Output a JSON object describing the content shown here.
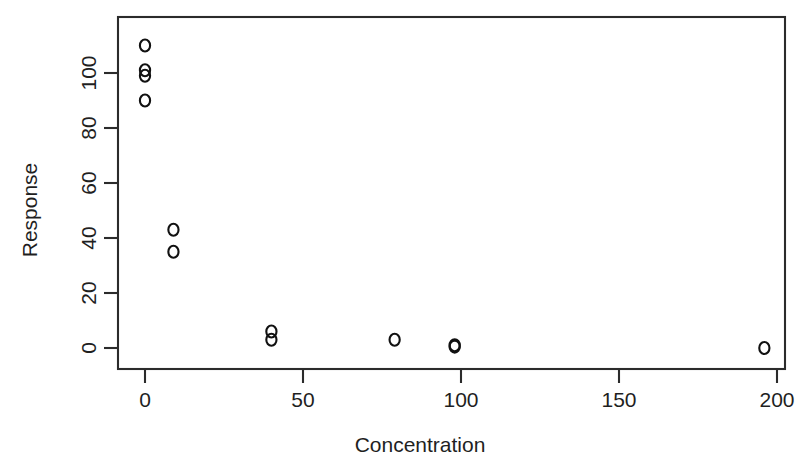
{
  "figure": {
    "name": "scatter-plot-concentration-response",
    "background": "#ffffff",
    "foreground": "#1f1f1f"
  },
  "chart_data": {
    "type": "scatter",
    "title": "",
    "subtitle": "",
    "xlabel": "Concentration",
    "ylabel": "Response",
    "xlim": [
      -8,
      208
    ],
    "ylim": [
      -6,
      118
    ],
    "xticks": [
      0,
      50,
      100,
      150,
      200
    ],
    "xtick_labels": [
      "0",
      "50",
      "100",
      "150",
      "200"
    ],
    "yticks": [
      0,
      20,
      40,
      60,
      80,
      100
    ],
    "ytick_labels": [
      "0",
      "20",
      "40",
      "60",
      "80",
      "100"
    ],
    "grid": false,
    "legend": null,
    "marker": "open-circle",
    "marker_size": 6,
    "series": [
      {
        "name": "observations",
        "x": [
          0,
          0,
          0,
          0,
          9,
          9,
          40,
          40,
          79,
          98,
          98,
          196
        ],
        "y": [
          110,
          101,
          99,
          90,
          43,
          35,
          6,
          3,
          3,
          1,
          0.5,
          0
        ]
      }
    ],
    "points": [
      {
        "x": 0,
        "y": 110
      },
      {
        "x": 0,
        "y": 101
      },
      {
        "x": 0,
        "y": 99
      },
      {
        "x": 0,
        "y": 90
      },
      {
        "x": 9,
        "y": 43
      },
      {
        "x": 9,
        "y": 35
      },
      {
        "x": 40,
        "y": 6
      },
      {
        "x": 40,
        "y": 3
      },
      {
        "x": 79,
        "y": 3
      },
      {
        "x": 98,
        "y": 1
      },
      {
        "x": 98,
        "y": 0.5
      },
      {
        "x": 196,
        "y": 0
      }
    ],
    "annotations": []
  }
}
